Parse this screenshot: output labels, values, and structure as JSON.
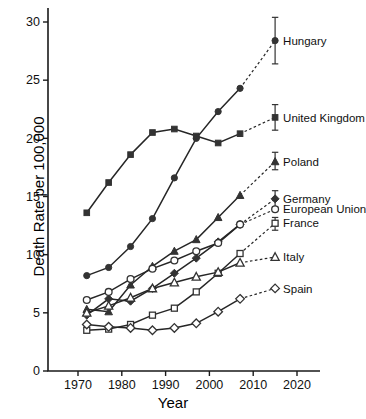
{
  "chart_data": {
    "type": "line",
    "title": "",
    "xlabel": "Year",
    "ylabel": "Death Rate per 100,000",
    "xlim": [
      1964,
      2026
    ],
    "ylim": [
      0,
      31.5
    ],
    "xticks": [
      1970,
      1980,
      1990,
      2000,
      2010,
      2020
    ],
    "yticks": [
      0,
      5,
      10,
      15,
      20,
      25,
      30
    ],
    "grid": false,
    "legend_position": "right-inline",
    "series": [
      {
        "name": "Hungary",
        "marker": "filled-circle",
        "x": [
          1972,
          1977,
          1982,
          1987,
          1992,
          1997,
          2002,
          2007
        ],
        "y": [
          8.2,
          8.9,
          10.7,
          13.1,
          16.6,
          20.0,
          22.3,
          24.3
        ],
        "projected_x": 2015,
        "projected_y": 28.4,
        "error_low": 26.4,
        "error_high": 30.4
      },
      {
        "name": "United Kingdom",
        "marker": "filled-square",
        "x": [
          1972,
          1977,
          1982,
          1987,
          1992,
          1997,
          2002,
          2007
        ],
        "y": [
          13.6,
          16.2,
          18.6,
          20.5,
          20.8,
          20.2,
          19.6,
          20.4
        ],
        "projected_x": 2015,
        "projected_y": 21.8,
        "error_low": 20.7,
        "error_high": 22.9
      },
      {
        "name": "Poland",
        "marker": "filled-triangle",
        "x": [
          1972,
          1977,
          1982,
          1987,
          1992,
          1997,
          2002,
          2007
        ],
        "y": [
          5.3,
          5.1,
          7.4,
          9.0,
          10.3,
          11.3,
          13.2,
          15.1
        ],
        "projected_x": 2015,
        "projected_y": 18.0,
        "error_low": 17.3,
        "error_high": 18.8
      },
      {
        "name": "Germany",
        "marker": "filled-diamond",
        "x": [
          1972,
          1977,
          1982,
          1987,
          1992,
          1997,
          2002,
          2007
        ],
        "y": [
          4.8,
          6.2,
          6.0,
          7.1,
          8.4,
          9.7,
          11.1,
          12.6
        ],
        "projected_x": 2015,
        "projected_y": 14.8,
        "error_low": 14.1,
        "error_high": 15.5
      },
      {
        "name": "European Union",
        "marker": "open-circle",
        "x": [
          1972,
          1977,
          1982,
          1987,
          1992,
          1997,
          2002,
          2007
        ],
        "y": [
          6.1,
          6.8,
          7.9,
          8.8,
          9.5,
          10.3,
          11.0,
          12.6
        ],
        "projected_x": 2015,
        "projected_y": 13.9,
        "error_low": 13.9,
        "error_high": 13.9
      },
      {
        "name": "France",
        "marker": "open-square",
        "x": [
          1972,
          1977,
          1982,
          1987,
          1992,
          1997,
          2002,
          2007
        ],
        "y": [
          3.5,
          3.6,
          4.0,
          4.8,
          5.4,
          6.8,
          8.4,
          10.1
        ],
        "projected_x": 2015,
        "projected_y": 12.7,
        "error_low": 12.1,
        "error_high": 13.2
      },
      {
        "name": "Italy",
        "marker": "open-triangle",
        "x": [
          1972,
          1977,
          1982,
          1987,
          1992,
          1997,
          2002,
          2007
        ],
        "y": [
          5.0,
          5.6,
          6.3,
          7.1,
          7.6,
          8.1,
          8.5,
          9.3
        ],
        "projected_x": 2015,
        "projected_y": 9.8,
        "error_low": 9.8,
        "error_high": 9.8
      },
      {
        "name": "Spain",
        "marker": "open-diamond",
        "x": [
          1972,
          1977,
          1982,
          1987,
          1992,
          1997,
          2002,
          2007
        ],
        "y": [
          4.0,
          3.8,
          3.7,
          3.5,
          3.7,
          4.1,
          5.1,
          6.2
        ],
        "projected_x": 2015,
        "projected_y": 7.1,
        "error_low": 7.1,
        "error_high": 7.1
      }
    ],
    "legend": [
      {
        "label": "Hungary",
        "marker": "filled-circle",
        "value": 28.4
      },
      {
        "label": "United Kingdom",
        "marker": "filled-square",
        "value": 21.8
      },
      {
        "label": "Poland",
        "marker": "filled-triangle",
        "value": 18.0
      },
      {
        "label": "Germany",
        "marker": "filled-diamond",
        "value": 14.8
      },
      {
        "label": "European Union",
        "marker": "open-circle",
        "value": 13.9
      },
      {
        "label": "France",
        "marker": "open-square",
        "value": 12.7
      },
      {
        "label": "Italy",
        "marker": "open-triangle",
        "value": 9.8
      },
      {
        "label": "Spain",
        "marker": "open-diamond",
        "value": 7.1
      }
    ]
  },
  "axes": {
    "y_label": "Death Rate per 100,000",
    "x_label": "Year",
    "y_tick_labels": [
      "0",
      "5",
      "10",
      "15",
      "20",
      "25",
      "30"
    ],
    "x_tick_labels": [
      "1970",
      "1980",
      "1990",
      "2000",
      "2010",
      "2020"
    ]
  },
  "colors": {
    "marker": "#333333",
    "line": "#262626",
    "axis": "#1a1a1a",
    "background": "#ffffff"
  }
}
